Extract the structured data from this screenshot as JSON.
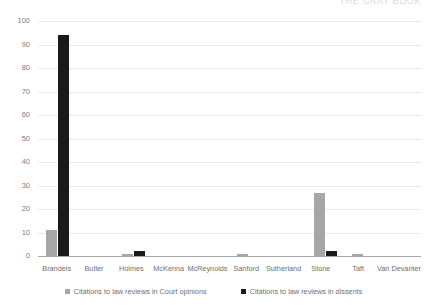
{
  "header": {
    "cut_off_text": "THE GRAY BOOK"
  },
  "chart_data": {
    "type": "bar",
    "title": "",
    "subtitle": "",
    "xlabel": "",
    "ylabel": "",
    "ylim": [
      0,
      100
    ],
    "yticks": [
      0,
      10,
      20,
      30,
      40,
      50,
      60,
      70,
      80,
      90,
      100
    ],
    "ytick_labels": [
      "0",
      "10",
      "20",
      "30",
      "40",
      "50",
      "60",
      "70",
      "80",
      "90",
      "100"
    ],
    "grid": true,
    "legend_position": "bottom",
    "categories": [
      "Brandeis",
      "Butler",
      "Holmes",
      "McKenna",
      "McReynolds",
      "Sanford",
      "Sutherland",
      "Stone",
      "Taft",
      "Van Devanter"
    ],
    "series": [
      {
        "name": "Citations to law reviews in Court opinions",
        "color": "#a6a6a6",
        "values": [
          11,
          0,
          1,
          0,
          0,
          1,
          0,
          27,
          1,
          0
        ]
      },
      {
        "name": "Citations to law reviews in dissents",
        "color": "#1a1a1a",
        "values": [
          94,
          0,
          2,
          0,
          0,
          0,
          0,
          2,
          0,
          0
        ]
      }
    ]
  },
  "colors": {
    "series_0": "#a6a6a6",
    "series_1": "#1a1a1a",
    "gridline": "#e8e8e8",
    "axis": "#a8a8a8",
    "text": "#707070"
  }
}
